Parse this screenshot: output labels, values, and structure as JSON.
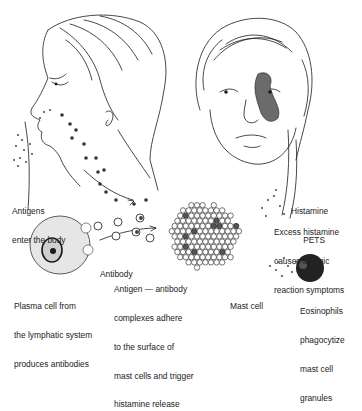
{
  "diagram": {
    "type": "allergic reaction pathway illustration",
    "labels": {
      "antigens": [
        "Antigens",
        "enter the body"
      ],
      "plasma_cell": [
        "Plasma cell from",
        "the lymphatic system",
        "produces antibodies"
      ],
      "antibody": [
        "Antibody"
      ],
      "complexes": [
        "Antigen — antibody",
        "complexes adhere",
        "to the surface of",
        "mast cells and trigger",
        "histamine release"
      ],
      "mast_cell": [
        "Mast cell"
      ],
      "histamine": [
        "Histamine",
        "PETS"
      ],
      "excess": [
        "Excess histamine",
        "causes allergic",
        "reaction symptoms"
      ],
      "eosinophils": [
        "Eosinophils",
        "phagocytize",
        "mast cell",
        "granules"
      ]
    },
    "colors": {
      "line": "#1a1a1a",
      "background": "#ffffff",
      "rash": "#6b6b6b"
    }
  }
}
